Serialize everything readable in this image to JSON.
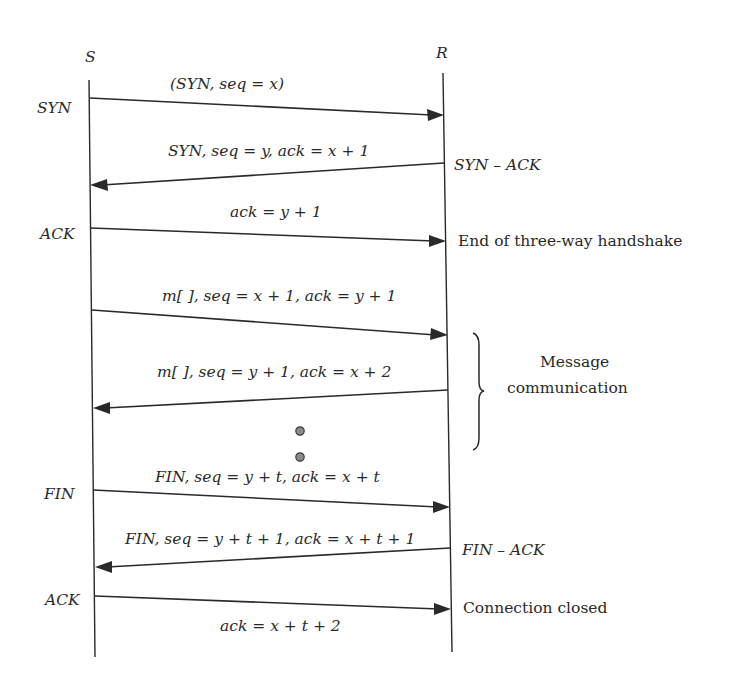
{
  "diagram": {
    "type": "sequence",
    "participants": [
      {
        "id": "S",
        "label": "S"
      },
      {
        "id": "R",
        "label": "R"
      }
    ],
    "messages": [
      {
        "from": "S",
        "to": "R",
        "label": "(SYN, seq = x)",
        "sender_note": "SYN",
        "receiver_note": ""
      },
      {
        "from": "R",
        "to": "S",
        "label": "SYN, seq = y, ack = x + 1",
        "sender_note": "SYN – ACK",
        "receiver_note": ""
      },
      {
        "from": "S",
        "to": "R",
        "label": "ack = y + 1",
        "sender_note": "ACK",
        "receiver_note": "End of three-way handshake"
      },
      {
        "from": "S",
        "to": "R",
        "label": "m[ ], seq = x + 1, ack = y + 1",
        "sender_note": "",
        "receiver_note": ""
      },
      {
        "from": "R",
        "to": "S",
        "label": "m[ ], seq = y + 1, ack = x + 2",
        "sender_note": "",
        "receiver_note": ""
      },
      {
        "from": "S",
        "to": "R",
        "label": "FIN, seq = y + t, ack = x + t",
        "sender_note": "FIN",
        "receiver_note": ""
      },
      {
        "from": "R",
        "to": "S",
        "label": "FIN, seq = y + t + 1, ack = x + t + 1",
        "sender_note": "FIN – ACK",
        "receiver_note": ""
      },
      {
        "from": "S",
        "to": "R",
        "label": "ack = x + t + 2",
        "sender_note": "ACK",
        "receiver_note": "Connection closed"
      }
    ],
    "annotations": {
      "message_group": {
        "line1": "Message",
        "line2": "communication"
      },
      "ellipsis": "continuation dots"
    }
  }
}
